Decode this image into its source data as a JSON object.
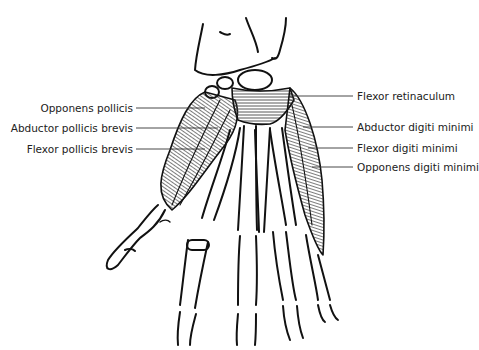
{
  "diagram": {
    "labels_left": [
      {
        "text": "Opponens pollicis",
        "y": 103
      },
      {
        "text": "Abductor pollicis brevis",
        "y": 123
      },
      {
        "text": "Flexor pollicis brevis",
        "y": 144
      }
    ],
    "labels_right": [
      {
        "text": "Flexor retinaculum",
        "y": 91
      },
      {
        "text": "Abductor digiti minimi",
        "y": 122
      },
      {
        "text": "Flexor digiti minimi",
        "y": 143
      },
      {
        "text": "Opponens digiti minimi",
        "y": 162
      }
    ],
    "colors": {
      "line": "#111111",
      "label": "#222222",
      "muscle_fill": "#555555",
      "background": "#ffffff"
    }
  }
}
